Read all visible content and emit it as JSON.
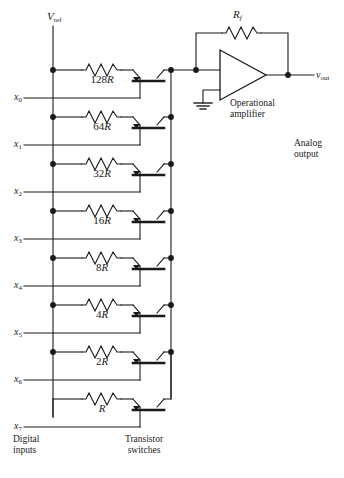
{
  "figure": {
    "type": "binary-weighted-resistor-dac-circuit",
    "background": "#ffffff",
    "line_color": "#1a1a1a",
    "text_color": "#1a1a1a"
  },
  "supply": {
    "label_main": "V",
    "label_sub": "ref"
  },
  "rows": [
    {
      "resistor_value": "128",
      "resistor_unit": "R",
      "input_main": "x",
      "input_sub": "0"
    },
    {
      "resistor_value": "64",
      "resistor_unit": "R",
      "input_main": "x",
      "input_sub": "1"
    },
    {
      "resistor_value": "32",
      "resistor_unit": "R",
      "input_main": "x",
      "input_sub": "2"
    },
    {
      "resistor_value": "16",
      "resistor_unit": "R",
      "input_main": "x",
      "input_sub": "3"
    },
    {
      "resistor_value": "8",
      "resistor_unit": "R",
      "input_main": "x",
      "input_sub": "4"
    },
    {
      "resistor_value": "4",
      "resistor_unit": "R",
      "input_main": "x",
      "input_sub": "5"
    },
    {
      "resistor_value": "2",
      "resistor_unit": "R",
      "input_main": "x",
      "input_sub": "6"
    },
    {
      "resistor_value": "",
      "resistor_unit": "R",
      "input_main": "x",
      "input_sub": "7"
    }
  ],
  "feedback": {
    "label_main": "R",
    "label_sub": "f"
  },
  "opamp": {
    "caption_line1": "Operational",
    "caption_line2": "amplifier"
  },
  "output": {
    "label_main": "v",
    "label_sub": "out",
    "caption_line1": "Analog",
    "caption_line2": "output"
  },
  "captions": {
    "digital_inputs_line1": "Digital",
    "digital_inputs_line2": "inputs",
    "transistor_switches_line1": "Transistor",
    "transistor_switches_line2": "switches"
  }
}
